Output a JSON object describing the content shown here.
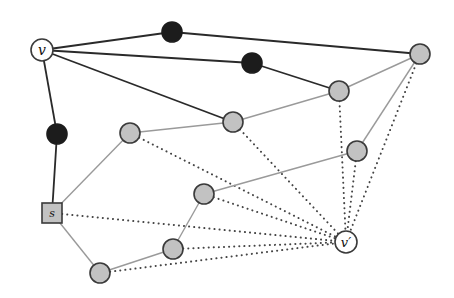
{
  "diagram": {
    "type": "graph",
    "colors": {
      "dark_edge": "#2a2a2a",
      "gray_edge": "#9a9a9a",
      "dotted_edge": "#444444",
      "black_node": "#1c1c1c",
      "gray_node_fill": "#c2c2c2",
      "node_stroke": "#3a3a3a",
      "white_node_fill": "#ffffff"
    },
    "nodes": [
      {
        "id": "v",
        "label": "v",
        "kind": "white",
        "x": 42,
        "y": 50
      },
      {
        "id": "b1",
        "label": "",
        "kind": "black",
        "x": 172,
        "y": 32
      },
      {
        "id": "b2",
        "label": "",
        "kind": "black",
        "x": 252,
        "y": 63
      },
      {
        "id": "b3",
        "label": "",
        "kind": "black",
        "x": 57,
        "y": 134
      },
      {
        "id": "g1",
        "label": "",
        "kind": "gray",
        "x": 420,
        "y": 54
      },
      {
        "id": "g2",
        "label": "",
        "kind": "gray",
        "x": 339,
        "y": 91
      },
      {
        "id": "g3",
        "label": "",
        "kind": "gray",
        "x": 233,
        "y": 122
      },
      {
        "id": "g4",
        "label": "",
        "kind": "gray",
        "x": 130,
        "y": 133
      },
      {
        "id": "g5",
        "label": "",
        "kind": "gray",
        "x": 357,
        "y": 151
      },
      {
        "id": "g6",
        "label": "",
        "kind": "gray",
        "x": 204,
        "y": 194
      },
      {
        "id": "g7",
        "label": "",
        "kind": "gray",
        "x": 173,
        "y": 249
      },
      {
        "id": "g8",
        "label": "",
        "kind": "gray",
        "x": 100,
        "y": 273
      },
      {
        "id": "s",
        "label": "s",
        "kind": "square",
        "x": 52,
        "y": 213
      },
      {
        "id": "vp",
        "label": "v′",
        "kind": "white",
        "x": 346,
        "y": 242
      }
    ],
    "edges": {
      "dark": [
        [
          "v",
          "b1"
        ],
        [
          "b1",
          "g1"
        ],
        [
          "v",
          "b2"
        ],
        [
          "b2",
          "g2"
        ],
        [
          "v",
          "g3"
        ],
        [
          "v",
          "b3"
        ],
        [
          "b3",
          "s"
        ]
      ],
      "gray": [
        [
          "s",
          "g4"
        ],
        [
          "g4",
          "g3"
        ],
        [
          "g3",
          "g2"
        ],
        [
          "g2",
          "g1"
        ],
        [
          "g1",
          "g5"
        ],
        [
          "g5",
          "g6"
        ],
        [
          "g6",
          "g7"
        ],
        [
          "g7",
          "g8"
        ],
        [
          "g8",
          "s"
        ]
      ],
      "dotted": [
        [
          "s",
          "vp"
        ],
        [
          "g4",
          "vp"
        ],
        [
          "g3",
          "vp"
        ],
        [
          "g2",
          "vp"
        ],
        [
          "g1",
          "vp"
        ],
        [
          "g5",
          "vp"
        ],
        [
          "g6",
          "vp"
        ],
        [
          "g7",
          "vp"
        ],
        [
          "g8",
          "vp"
        ]
      ]
    },
    "labels": {
      "v": "v",
      "s": "s",
      "vp": "v′"
    }
  }
}
